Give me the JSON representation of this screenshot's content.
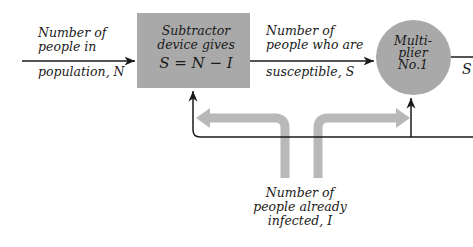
{
  "diagram": {
    "input_label": {
      "line1": "Number of",
      "line2": "people in",
      "line3": "population, N"
    },
    "subtractor": {
      "line1": "Subtractor",
      "line2": "device gives",
      "line3": "S = N − I"
    },
    "susceptible_label": {
      "line1": "Number of",
      "line2": "people who are",
      "line3": "susceptible, S"
    },
    "multiplier": {
      "line1": "Multi-",
      "line2": "plier",
      "line3": "No.1"
    },
    "output_label": "S",
    "infected_label": {
      "line1": "Number of",
      "line2": "people already",
      "line3": "infected, I"
    },
    "colors": {
      "block_fill": "#a9a9a9",
      "flow_arrow": "#b8b8b8",
      "line": "#1a1a1a"
    }
  }
}
